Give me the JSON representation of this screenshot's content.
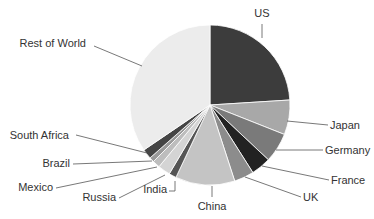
{
  "chart_data": {
    "type": "pie",
    "title": "",
    "center": [
      210,
      105
    ],
    "radius": 80,
    "start_angle_deg": 0,
    "direction": "clockwise",
    "legend": "none (leader-line labels)",
    "slices": [
      {
        "label": "US",
        "value": 24,
        "color": "#3c3c3c",
        "label_pos": [
          262,
          17
        ],
        "anchor": "middle",
        "line": [
          [
            262,
            24
          ],
          [
            262,
            38
          ]
        ]
      },
      {
        "label": "Japan",
        "value": 7,
        "color": "#a8a8a8",
        "label_pos": [
          330,
          129
        ],
        "anchor": "start",
        "line": [
          [
            287,
            121
          ],
          [
            328,
            125
          ]
        ]
      },
      {
        "label": "Germany",
        "value": 6,
        "color": "#7a7a7a",
        "label_pos": [
          325,
          154
        ],
        "anchor": "start",
        "line": [
          [
            276,
            150
          ],
          [
            323,
            150
          ]
        ]
      },
      {
        "label": "France",
        "value": 4,
        "color": "#222222",
        "label_pos": [
          331,
          184
        ],
        "anchor": "start",
        "line": [
          [
            262,
            166
          ],
          [
            329,
            180
          ]
        ]
      },
      {
        "label": "UK",
        "value": 4,
        "color": "#8c8c8c",
        "label_pos": [
          303,
          201
        ],
        "anchor": "start",
        "line": [
          [
            245,
            177
          ],
          [
            301,
            197
          ]
        ]
      },
      {
        "label": "China",
        "value": 12,
        "color": "#c4c4c4",
        "label_pos": [
          212,
          210
        ],
        "anchor": "middle",
        "line": [
          [
            212,
            186
          ],
          [
            212,
            197
          ]
        ]
      },
      {
        "label": "India",
        "value": 1.5,
        "color": "#555555",
        "label_pos": [
          167,
          193
        ],
        "anchor": "end",
        "line": [
          [
            175,
            181
          ],
          [
            175,
            191
          ],
          [
            169,
            191
          ]
        ]
      },
      {
        "label": "Russia",
        "value": 2.5,
        "color": "#d4d4d4",
        "label_pos": [
          116,
          201
        ],
        "anchor": "end",
        "line": [
          [
            165,
            175
          ],
          [
            119,
            198
          ]
        ]
      },
      {
        "label": "Mexico",
        "value": 1.5,
        "color": "#bdbdbd",
        "label_pos": [
          53,
          191
        ],
        "anchor": "end",
        "line": [
          [
            157,
            167
          ],
          [
            56,
            188
          ]
        ]
      },
      {
        "label": "Brazil",
        "value": 1,
        "color": "#9a9a9a",
        "label_pos": [
          70,
          167
        ],
        "anchor": "end",
        "line": [
          [
            152,
            161
          ],
          [
            73,
            164
          ]
        ]
      },
      {
        "label": "South Africa",
        "value": 2,
        "color": "#454545",
        "label_pos": [
          69,
          139
        ],
        "anchor": "end",
        "line": [
          [
            147,
            153
          ],
          [
            76,
            135
          ]
        ]
      },
      {
        "label": "Rest of World",
        "value": 34.5,
        "color": "#ececec",
        "label_pos": [
          86,
          47
        ],
        "anchor": "end",
        "line": [
          [
            94,
            46
          ],
          [
            142,
            66
          ]
        ]
      }
    ]
  }
}
